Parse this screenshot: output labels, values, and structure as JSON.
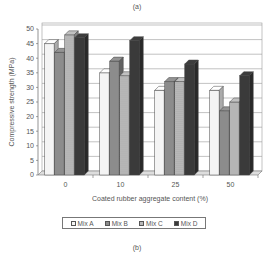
{
  "captions": {
    "top": "(a)",
    "bottom": "(b)"
  },
  "colors": {
    "Mix A": "#f4f4f4",
    "Mix B": "#8c8c8c",
    "Mix C": "#b8b8b8",
    "Mix D": "#3a3a3a"
  },
  "chart_data": {
    "type": "bar",
    "title": "",
    "xlabel": "Coated rubber aggregate content (%)",
    "ylabel": "Compressive strength (MPa)",
    "categories": [
      "0",
      "10",
      "25",
      "50"
    ],
    "series": [
      {
        "name": "Mix A",
        "values": [
          45,
          35,
          29,
          29
        ]
      },
      {
        "name": "Mix B",
        "values": [
          42,
          39,
          32,
          22
        ]
      },
      {
        "name": "Mix C",
        "values": [
          48,
          34,
          32,
          25
        ]
      },
      {
        "name": "Mix D",
        "values": [
          47,
          46,
          38,
          34
        ]
      }
    ],
    "ylim": [
      0,
      50
    ],
    "yticks": [
      0,
      5,
      10,
      15,
      20,
      25,
      30,
      35,
      40,
      45,
      50
    ],
    "grid": true,
    "style": "3d-clustered-bar",
    "legend_position": "bottom"
  }
}
